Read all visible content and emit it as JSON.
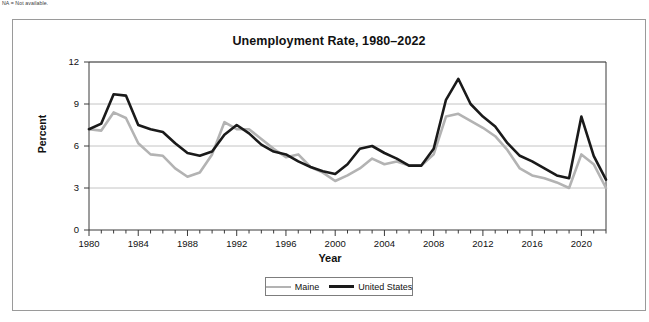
{
  "footnote": "NA = Not available.",
  "chart_data": {
    "type": "line",
    "title": "Unemployment Rate, 1980–2022",
    "xlabel": "Year",
    "ylabel": "Percent",
    "xlim": [
      1980,
      2022
    ],
    "ylim": [
      0,
      12
    ],
    "yticks": [
      0,
      3,
      6,
      9,
      12
    ],
    "xticks": [
      1980,
      1984,
      1988,
      1992,
      1996,
      2000,
      2004,
      2008,
      2012,
      2016,
      2020
    ],
    "grid": "horizontal",
    "legend_position": "bottom-center",
    "x": [
      1980,
      1981,
      1982,
      1983,
      1984,
      1985,
      1986,
      1987,
      1988,
      1989,
      1990,
      1991,
      1992,
      1993,
      1994,
      1995,
      1996,
      1997,
      1998,
      1999,
      2000,
      2001,
      2002,
      2003,
      2004,
      2005,
      2006,
      2007,
      2008,
      2009,
      2010,
      2011,
      2012,
      2013,
      2014,
      2015,
      2016,
      2017,
      2018,
      2019,
      2020,
      2021,
      2022
    ],
    "series": [
      {
        "name": "Maine",
        "color": "#b3b3b3",
        "values": [
          7.2,
          7.1,
          8.4,
          8.0,
          6.2,
          5.4,
          5.3,
          4.4,
          3.8,
          4.1,
          5.4,
          7.7,
          7.2,
          7.2,
          6.5,
          5.8,
          5.2,
          5.4,
          4.5,
          4.1,
          3.5,
          3.9,
          4.4,
          5.1,
          4.7,
          4.9,
          4.6,
          4.6,
          5.4,
          8.1,
          8.3,
          7.8,
          7.3,
          6.7,
          5.7,
          4.4,
          3.9,
          3.7,
          3.4,
          3.0,
          5.4,
          4.7,
          3.0
        ]
      },
      {
        "name": "United States",
        "color": "#1a1a1a",
        "values": [
          7.2,
          7.6,
          9.7,
          9.6,
          7.5,
          7.2,
          7.0,
          6.2,
          5.5,
          5.3,
          5.6,
          6.8,
          7.5,
          6.9,
          6.1,
          5.6,
          5.4,
          4.9,
          4.5,
          4.2,
          4.0,
          4.7,
          5.8,
          6.0,
          5.5,
          5.1,
          4.6,
          4.6,
          5.8,
          9.3,
          10.8,
          9.0,
          8.1,
          7.4,
          6.2,
          5.3,
          4.9,
          4.4,
          3.9,
          3.7,
          8.1,
          5.3,
          3.6
        ]
      }
    ]
  }
}
